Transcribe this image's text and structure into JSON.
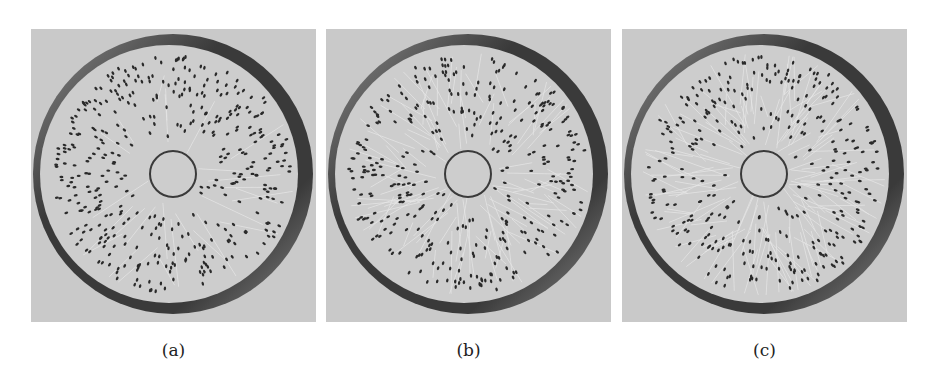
{
  "figure": {
    "panels": [
      {
        "id": "a",
        "caption": "(a)",
        "left": 31,
        "crack_density": 0.15,
        "seed": 11
      },
      {
        "id": "b",
        "caption": "(b)",
        "left": 326,
        "crack_density": 0.55,
        "seed": 23
      },
      {
        "id": "c",
        "caption": "(c)",
        "left": 622,
        "crack_density": 0.75,
        "seed": 37
      }
    ],
    "colors": {
      "background": "#c9c9c9",
      "disk": "#cdcdcd",
      "ring_dark": "#3a3a3a",
      "ring_light": "#8a8a8a",
      "particles": "#2a2a2a",
      "cracks": "#e8e8e8",
      "inner_circle": "#3a3a3a"
    }
  }
}
